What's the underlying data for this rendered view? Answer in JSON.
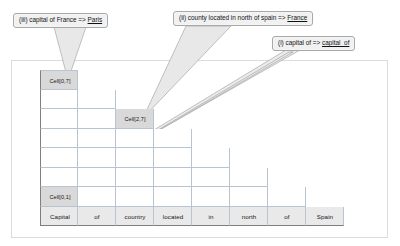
{
  "figure": {
    "type": "cyk-parse-chart",
    "caption": ""
  },
  "callouts": [
    {
      "id": "callout-iii",
      "marker": "(iii)",
      "text": "(iii) capital of France => ",
      "underlined": "Paris",
      "points_to": "Cell[0,7]"
    },
    {
      "id": "callout-ii",
      "marker": "(ii)",
      "text": "(ii) county located in north of spain => ",
      "underlined": "France",
      "points_to": "Cell[2,7]"
    },
    {
      "id": "callout-i",
      "marker": "(i)",
      "text": "(i) capital of => ",
      "underlined": "capital_of",
      "points_to": "Cell[0,1]"
    }
  ],
  "chart": {
    "columns": 8,
    "rows": 8,
    "labeled_cells": [
      {
        "row": 0,
        "col": 0,
        "label": "Cell[0,7]"
      },
      {
        "row": 2,
        "col": 2,
        "label": "Cell[2,7]"
      },
      {
        "row": 6,
        "col": 0,
        "label": "Cell[0,1]"
      }
    ],
    "tokens": [
      "Capital",
      "of",
      "country",
      "located",
      "in",
      "north",
      "of",
      "Spain"
    ],
    "row_widths": [
      1,
      2,
      3,
      4,
      5,
      6,
      7,
      8
    ]
  },
  "colors": {
    "grid_line": "#b9c4d2",
    "grid_edge": "#7f7f7f",
    "highlight": "#d9d9d9",
    "token_row": "#e9e9e9",
    "callout_fill": "#f1f1f1",
    "callout_border": "#a8a8a8",
    "tail_fill": "#e8e8e8",
    "frame_border": "#dcdcdc",
    "page_background": "#ffffff"
  }
}
